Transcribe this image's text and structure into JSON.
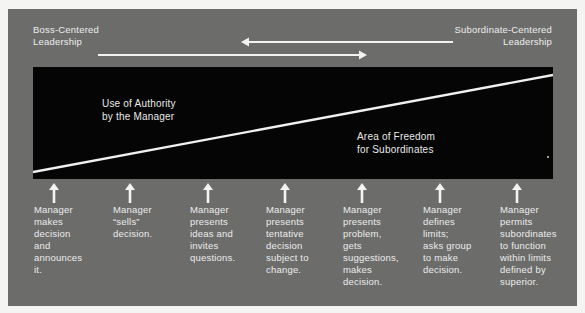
{
  "header": {
    "left_label": [
      "Boss-Centered",
      "Leadership"
    ],
    "right_label": [
      "Subordinate-Centered",
      "Leadership"
    ]
  },
  "arrows": {
    "left_pointing": {
      "from_x": 453,
      "to_x": 242,
      "y": 42
    },
    "right_pointing": {
      "from_x": 98,
      "to_x": 366,
      "y": 55
    }
  },
  "diagram": {
    "upper_region_label": [
      "Use of Authority",
      "by the Manager"
    ],
    "lower_region_label": [
      "Area of Freedom",
      "for Subordinates"
    ],
    "divider_line": {
      "start": [
        33,
        172
      ],
      "end": [
        552,
        75
      ]
    }
  },
  "behaviors": [
    {
      "lines": [
        "Manager",
        "makes",
        "decision",
        "and",
        "announces",
        "it."
      ]
    },
    {
      "lines": [
        "Manager",
        "“sells”",
        "decision."
      ]
    },
    {
      "lines": [
        "Manager",
        "presents",
        "ideas and",
        "invites",
        "questions."
      ]
    },
    {
      "lines": [
        "Manager",
        "presents",
        "tentative",
        "decision",
        "subject to",
        "change."
      ]
    },
    {
      "lines": [
        "Manager",
        "presents",
        "problem,",
        "gets",
        "suggestions,",
        "makes",
        "decision."
      ]
    },
    {
      "lines": [
        "Manager",
        "defines",
        "limits;",
        "asks group",
        "to make",
        "decision."
      ]
    },
    {
      "lines": [
        "Manager",
        "permits",
        "subordinates",
        "to function",
        "within limits",
        "defined by",
        "superior."
      ]
    }
  ],
  "colors": {
    "panel": "#6c6c6b",
    "chart_area": "#050505",
    "text": "#eeeeee",
    "page_bg": "#f4f4f2"
  }
}
